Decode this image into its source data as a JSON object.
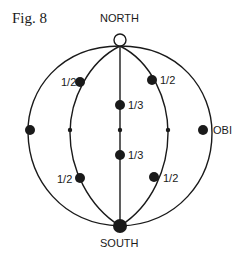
{
  "figure": {
    "title": "Fig. 8",
    "poles": {
      "north": "NORTH",
      "south": "SOUTH"
    },
    "labels": {
      "upper_left_meridian": "1/2",
      "upper_right_meridian": "1/2",
      "central_upper": "1/3",
      "central_lower": "1/3",
      "lower_left_meridian": "1/2",
      "lower_right_meridian": "1/2",
      "right_equator": "OBI"
    },
    "colors": {
      "ink": "#1a1a1a",
      "background": "#ffffff"
    }
  }
}
